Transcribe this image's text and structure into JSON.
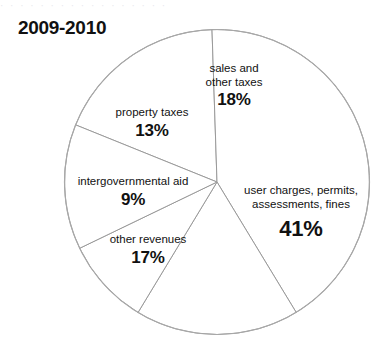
{
  "title": "2009-2010",
  "top_artifact_text": "· · ·   · ·   · ·   · · ·   ·   · ·  · ·  · ·",
  "colors": {
    "background": "#ffffff",
    "slice_fill": "#ffffff",
    "slice_stroke": "#9a9a9a",
    "outline": "#a8a8a8",
    "text": "#111111"
  },
  "chart_data": {
    "type": "pie",
    "title": "2009-2010",
    "xlabel": "",
    "ylabel": "",
    "units": "percent",
    "legend_position": "none",
    "grid": false,
    "labels_inside_slices": true,
    "categories": [
      "sales and other taxes",
      "user charges, permits, assessments, fines",
      "other revenues",
      "intergovernmental aid",
      "property taxes"
    ],
    "values": [
      18,
      41,
      17,
      9,
      13
    ],
    "total": 98,
    "slices": [
      {
        "label": "sales and other taxes",
        "label_line1": "sales and",
        "label_line2": "other taxes",
        "value": 18,
        "value_text": "18%"
      },
      {
        "label": "user charges, permits, assessments, fines",
        "label_line1": "user charges, permits,",
        "label_line2": "assessments, fines",
        "value": 41,
        "value_text": "41%"
      },
      {
        "label": "other revenues",
        "label_line1": "other revenues",
        "label_line2": "",
        "value": 17,
        "value_text": "17%"
      },
      {
        "label": "intergovernmental aid",
        "label_line1": "intergovernmental aid",
        "label_line2": "",
        "value": 9,
        "value_text": "9%"
      },
      {
        "label": "property taxes",
        "label_line1": "property taxes",
        "label_line2": "",
        "value": 13,
        "value_text": "13%"
      }
    ]
  }
}
